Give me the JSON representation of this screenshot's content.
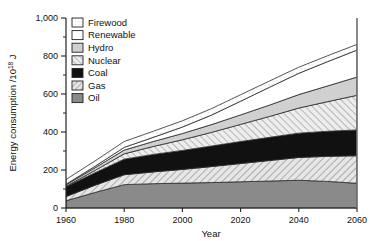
{
  "chart_data": {
    "type": "area",
    "title": "",
    "xlabel": "Year",
    "ylabel": "Energy consumption /10",
    "ylabel_exponent": "18",
    "ylabel_unit": " J",
    "xlim": [
      1960,
      2060
    ],
    "ylim": [
      0,
      1000
    ],
    "x_ticks": [
      1960,
      1980,
      2000,
      2020,
      2040,
      2060
    ],
    "x_tick_labels": [
      "1960",
      "1980",
      "2000",
      "2020",
      "2040",
      "2060"
    ],
    "y_ticks": [
      0,
      200,
      400,
      600,
      800,
      1000
    ],
    "y_tick_labels": [
      "0",
      "200",
      "400",
      "600",
      "800",
      "1,000"
    ],
    "y_minor_ticks": [
      100,
      300,
      500,
      700,
      900
    ],
    "grid": false,
    "stacked": true,
    "legend_position": "top-left",
    "x": [
      1960,
      1970,
      1980,
      1990,
      2000,
      2010,
      2020,
      2030,
      2040,
      2050,
      2060
    ],
    "series": [
      {
        "name": "Oil",
        "fill": "#8a8a8a",
        "pattern": "solid-gray",
        "values": [
          38,
          82,
          123,
          128,
          131,
          134,
          138,
          142,
          146,
          140,
          130
        ]
      },
      {
        "name": "Gas",
        "fill": "#dcdcdc",
        "pattern": "hatch-light",
        "values": [
          22,
          38,
          52,
          62,
          72,
          84,
          96,
          108,
          120,
          132,
          145
        ]
      },
      {
        "name": "Coal",
        "fill": "#111111",
        "pattern": "solid-black",
        "values": [
          52,
          66,
          82,
          92,
          100,
          108,
          116,
          122,
          128,
          132,
          136
        ]
      },
      {
        "name": "Nuclear",
        "fill": "#e2e2e2",
        "pattern": "hatch-diag",
        "values": [
          2,
          12,
          28,
          42,
          56,
          72,
          90,
          110,
          132,
          156,
          182
        ]
      },
      {
        "name": "Hydro",
        "fill": "#d0d0d0",
        "pattern": "solid-lightgray",
        "values": [
          8,
          14,
          20,
          26,
          33,
          41,
          50,
          60,
          71,
          83,
          96
        ]
      },
      {
        "name": "Renewable",
        "fill": "#ffffff",
        "pattern": "solid-white",
        "values": [
          3,
          8,
          14,
          22,
          34,
          50,
          72,
          94,
          112,
          128,
          142
        ]
      },
      {
        "name": "Firewood",
        "fill": "#fbfbfb",
        "pattern": "dotted",
        "values": [
          25,
          28,
          31,
          32,
          33,
          34,
          34,
          33,
          32,
          31,
          30
        ]
      }
    ],
    "totals": [
      150,
      248,
      350,
      404,
      459,
      523,
      596,
      669,
      741,
      802,
      861
    ],
    "legend_entries": [
      {
        "label": "Firewood",
        "pattern": "dotted"
      },
      {
        "label": "Renewable",
        "pattern": "solid-white"
      },
      {
        "label": "Hydro",
        "pattern": "solid-lightgray"
      },
      {
        "label": "Nuclear",
        "pattern": "hatch-diag"
      },
      {
        "label": "Coal",
        "pattern": "solid-black"
      },
      {
        "label": "Gas",
        "pattern": "hatch-light"
      },
      {
        "label": "Oil",
        "pattern": "solid-gray"
      }
    ]
  }
}
